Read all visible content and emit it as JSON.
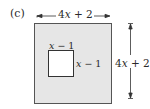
{
  "figure": {
    "part_label": "(c)",
    "outer_square": {
      "width_label": "4x + 2",
      "height_label": "4x + 2",
      "fill": "#e6e6e6",
      "stroke": "#555555"
    },
    "inner_square": {
      "top_label": "x − 1",
      "side_label": "x − 1",
      "fill": "#ffffff",
      "stroke": "#333333"
    }
  }
}
